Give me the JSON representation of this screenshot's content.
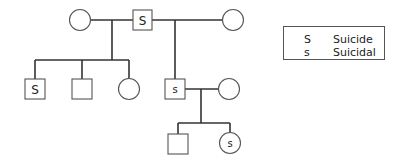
{
  "diagram": {
    "type": "pedigree",
    "generations": [
      {
        "id": "I",
        "members": [
          {
            "id": "I-1",
            "sex": "female",
            "mark": ""
          },
          {
            "id": "I-2",
            "sex": "male",
            "mark": "S"
          },
          {
            "id": "I-3",
            "sex": "female",
            "mark": ""
          }
        ]
      },
      {
        "id": "II",
        "members": [
          {
            "id": "II-1",
            "sex": "male",
            "mark": "S"
          },
          {
            "id": "II-2",
            "sex": "male",
            "mark": ""
          },
          {
            "id": "II-3",
            "sex": "female",
            "mark": ""
          },
          {
            "id": "II-4",
            "sex": "male",
            "mark": "s"
          },
          {
            "id": "II-5",
            "sex": "female",
            "mark": ""
          }
        ]
      },
      {
        "id": "III",
        "members": [
          {
            "id": "III-1",
            "sex": "male",
            "mark": ""
          },
          {
            "id": "III-2",
            "sex": "female",
            "mark": "s"
          }
        ]
      }
    ],
    "unions": [
      {
        "partners": [
          "I-1",
          "I-2"
        ],
        "children": [
          "II-1",
          "II-2",
          "II-3"
        ]
      },
      {
        "partners": [
          "I-2",
          "I-3"
        ],
        "children": [
          "II-4"
        ]
      },
      {
        "partners": [
          "II-4",
          "II-5"
        ],
        "children": [
          "III-1",
          "III-2"
        ]
      }
    ],
    "colors": {
      "line": "#333333",
      "shape_stroke": "#555555",
      "text": "#222222"
    }
  },
  "legend": {
    "items": [
      {
        "symbol": "S",
        "label": "Suicide"
      },
      {
        "symbol": "s",
        "label": "Suicidal"
      }
    ]
  }
}
